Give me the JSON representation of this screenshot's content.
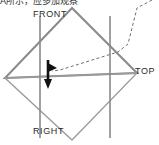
{
  "figure": {
    "name": "third-angle-projection-hexagram",
    "caption_text": "A所示，应多加观察",
    "labels": {
      "front": "FRONT",
      "top": "TOP",
      "right": "RIGHT"
    },
    "colors": {
      "line_gray": "#8a8a8a",
      "line_light_gray": "#9b9b9b",
      "arrow_black": "#111111",
      "dashed_gray": "#6f6f6f",
      "background": "#ffffff",
      "text": "#2b2b2b"
    },
    "annotations": {
      "arrow_direction": "down",
      "arrow_name": "viewing-direction-arrow",
      "leader_line_style": "dashed"
    },
    "geometry": {
      "triangle_up_points": "5,78 137,73 72,8",
      "triangle_down_points": "5,78 137,73 72,140",
      "vertical_line_left_x": 40,
      "vertical_line_right_x": 110,
      "vertical_line_top_y": 16,
      "vertical_line_bottom_y": 138,
      "arrow_x": 48,
      "arrow_top_y": 60,
      "arrow_bottom_y": 88,
      "dashed_path": "M 152,0 L 137,8 L 128,44 L 118,52 L 60,70 L 52,71"
    }
  }
}
